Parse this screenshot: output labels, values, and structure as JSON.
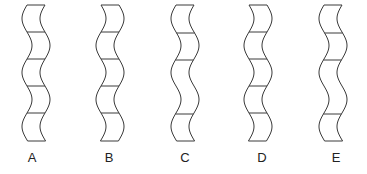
{
  "figure": {
    "options": [
      {
        "label": "A",
        "center_x": 36,
        "phase": 0,
        "dividers": [
          32,
          59,
          86,
          113
        ]
      },
      {
        "label": "B",
        "center_x": 110,
        "phase": 1,
        "dividers": [
          32,
          59,
          86,
          113
        ]
      },
      {
        "label": "C",
        "center_x": 185,
        "phase": 0,
        "dividers": [
          33,
          60,
          114
        ]
      },
      {
        "label": "D",
        "center_x": 258,
        "phase": 1,
        "dividers": [
          32,
          59,
          86,
          113
        ]
      },
      {
        "label": "E",
        "center_x": 333,
        "phase": 0,
        "dividers": [
          33,
          60,
          114
        ]
      }
    ],
    "top_y": 5,
    "bottom_y": 141,
    "strip_width": 18,
    "stroke_color": "#3a3a3a"
  }
}
